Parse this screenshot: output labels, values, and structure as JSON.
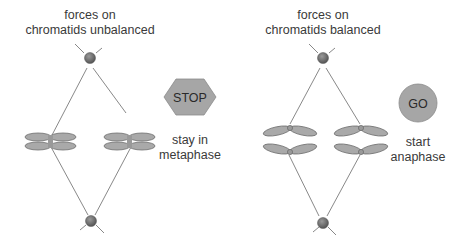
{
  "panels": [
    {
      "id": "unbalanced",
      "title_line1": "forces on",
      "title_line2": "chromatids unbalanced",
      "signal": {
        "shape": "hexagon",
        "label": "STOP",
        "color": "#a6a6a6"
      },
      "caption_line1": "stay in",
      "caption_line2": "metaphase"
    },
    {
      "id": "balanced",
      "title_line1": "forces on",
      "title_line2": "chromatids balanced",
      "signal": {
        "shape": "circle",
        "label": "GO",
        "color": "#a6a6a6"
      },
      "caption_line1": "start",
      "caption_line2": "anaphase"
    }
  ],
  "colors": {
    "chromatid_fill": "#a9a9a9",
    "chromatid_stroke": "#6e6e6e",
    "spindle_line": "#7a7a7a",
    "pole_fill": "#6b6b6b",
    "text": "#3a3a3a"
  }
}
